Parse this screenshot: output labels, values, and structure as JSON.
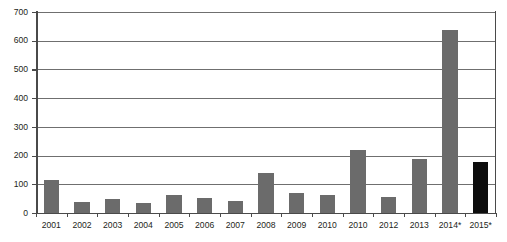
{
  "chart_data": {
    "type": "bar",
    "title": "",
    "subtitle": "",
    "xlabel": "",
    "ylabel": "",
    "ylim": [
      0,
      700
    ],
    "ytick_step": 100,
    "yticks": [
      0,
      100,
      200,
      300,
      400,
      500,
      600,
      700
    ],
    "grid": true,
    "legend": false,
    "legend_position": "none",
    "categories": [
      "2001",
      "2002",
      "2003",
      "2004",
      "2005",
      "2006",
      "2007",
      "2008",
      "2009",
      "2010",
      "2010",
      "2012",
      "2013",
      "2014*",
      "2015*"
    ],
    "values": [
      115,
      40,
      48,
      35,
      62,
      52,
      42,
      138,
      70,
      62,
      218,
      55,
      188,
      638,
      178
    ],
    "bar_colors": [
      "#6b6b6b",
      "#6b6b6b",
      "#6b6b6b",
      "#6b6b6b",
      "#6b6b6b",
      "#6b6b6b",
      "#6b6b6b",
      "#6b6b6b",
      "#6b6b6b",
      "#6b6b6b",
      "#6b6b6b",
      "#6b6b6b",
      "#6b6b6b",
      "#6b6b6b",
      "#0d0d0d"
    ],
    "series": [
      {
        "name": "",
        "values": [
          115,
          40,
          48,
          35,
          62,
          52,
          42,
          138,
          70,
          62,
          218,
          55,
          188,
          638,
          178
        ]
      }
    ],
    "annotations": []
  },
  "colors": {
    "bar_gray": "#6b6b6b",
    "bar_black": "#0d0d0d",
    "gridline": "#6f6f6f",
    "axis": "#4a4a4a",
    "text": "#231f20",
    "background": "#ffffff"
  }
}
